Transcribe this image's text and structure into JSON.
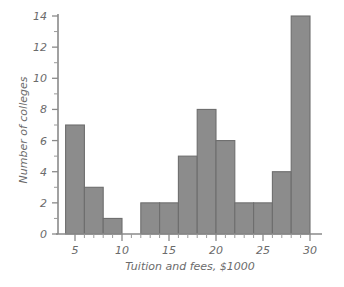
{
  "chart_data": {
    "type": "bar",
    "title": "",
    "subtitle": "",
    "xlabel": "Tuition and fees, $1000",
    "ylabel": "Number of colleges",
    "xlim": [
      3,
      31
    ],
    "ylim": [
      0,
      14.6
    ],
    "grid": false,
    "legend": null,
    "bin_width": 2,
    "bin_edges": [
      4,
      6,
      8,
      10,
      12,
      14,
      16,
      18,
      20,
      22,
      24,
      26,
      28,
      30
    ],
    "categories": [
      "4-6",
      "6-8",
      "8-10",
      "10-12",
      "12-14",
      "14-16",
      "16-18",
      "18-20",
      "20-22",
      "22-24",
      "24-26",
      "26-28",
      "28-30"
    ],
    "values": [
      7,
      3,
      1,
      0,
      2,
      2,
      5,
      8,
      6,
      2,
      2,
      4,
      14
    ],
    "x_ticks": [
      5,
      10,
      15,
      20,
      25,
      30
    ],
    "x_tick_labels": [
      "5",
      "10",
      "15",
      "20",
      "25",
      "30"
    ],
    "x_minor_ticks": [
      6,
      7,
      8,
      9,
      11,
      12,
      13,
      14,
      16,
      17,
      18,
      19,
      21,
      22,
      23,
      24,
      26,
      27,
      28,
      29
    ],
    "y_ticks": [
      0,
      2,
      4,
      6,
      8,
      10,
      12,
      14
    ],
    "y_tick_labels": [
      "0",
      "2",
      "4",
      "6",
      "8",
      "10",
      "12",
      "14"
    ],
    "y_minor_ticks": [
      1,
      3,
      5,
      7,
      9,
      11,
      13
    ],
    "bar_fill": "#8c8c8c",
    "bar_stroke": "#6e6e6e",
    "axis_color": "#8a8a8a",
    "text_color": "#6b6b6b",
    "background": "#ffffff"
  }
}
